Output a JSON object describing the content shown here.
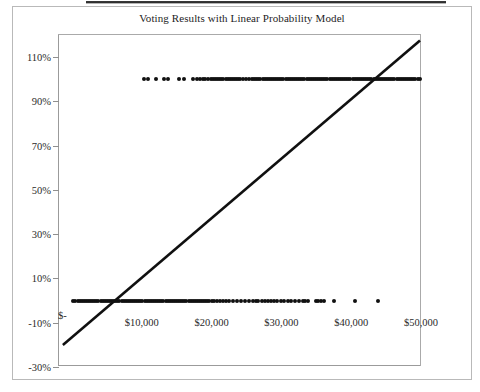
{
  "figure": {
    "title": "Voting Results with Linear Probability Model",
    "border_color": "#b9b9b9",
    "axis_color": "#9b9b9b",
    "marker_color": "#101010",
    "fit_line_color": "#101010",
    "background": "#ffffff"
  },
  "scan_artifact": {
    "present": true,
    "description": "dark horizontal scan band across top edge"
  },
  "chart_data": {
    "type": "scatter",
    "title": "Voting Results with Linear Probability Model",
    "xlabel": "",
    "ylabel": "",
    "xlim": [
      -2000,
      50000
    ],
    "ylim": [
      -0.3,
      1.2
    ],
    "grid": false,
    "legend": null,
    "y_tick_labels": [
      "110%",
      "90%",
      "70%",
      "50%",
      "30%",
      "10%",
      "-10%",
      "-30%"
    ],
    "y_tick_values": [
      1.1,
      0.9,
      0.7,
      0.5,
      0.3,
      0.1,
      -0.1,
      -0.3
    ],
    "x_tick_labels": [
      "$-",
      "$10,000",
      "$20,000",
      "$30,000",
      "$40,000",
      "$50,000"
    ],
    "x_tick_values": [
      0,
      10000,
      20000,
      30000,
      40000,
      50000
    ],
    "series": [
      {
        "name": "Voted (y = 1)",
        "y_value": 1.0,
        "marker": "diamond",
        "x_values": [
          10300,
          10900,
          12100,
          13200,
          13700,
          15400,
          16000,
          17300,
          17900,
          18300,
          18700,
          19100,
          19500,
          19900,
          20200,
          20500,
          20800,
          21100,
          21400,
          21700,
          22000,
          22300,
          22600,
          22900,
          23200,
          23500,
          23800,
          24100,
          24500,
          25000,
          25400,
          25800,
          26100,
          26400,
          26700,
          27000,
          27300,
          27600,
          27900,
          28200,
          28500,
          28800,
          29100,
          29400,
          29700,
          30000,
          30300,
          30600,
          30900,
          31200,
          31500,
          31800,
          32100,
          32400,
          32700,
          33000,
          33300,
          33600,
          33900,
          34200,
          34500,
          34800,
          35100,
          35400,
          35700,
          36000,
          36300,
          36600,
          36900,
          37200,
          37500,
          37800,
          38100,
          38400,
          38700,
          39000,
          39300,
          39600,
          39900,
          40200,
          40500,
          40800,
          41100,
          41400,
          41700,
          42000,
          42300,
          42600,
          42900,
          43200,
          43500,
          43800,
          44100,
          44400,
          44700,
          45000,
          45300,
          45600,
          45900,
          46200,
          46500,
          46800,
          47100,
          47400,
          47700,
          48000,
          48300,
          48600,
          48900,
          49200,
          49500,
          49800
        ]
      },
      {
        "name": "Did not vote (y = 0)",
        "y_value": 0.0,
        "marker": "diamond",
        "x_values": [
          200,
          500,
          800,
          1100,
          1400,
          1700,
          2000,
          2300,
          2600,
          2900,
          3200,
          3500,
          3800,
          4100,
          4400,
          4700,
          5000,
          5300,
          5600,
          5900,
          6200,
          6500,
          6800,
          7100,
          7400,
          7700,
          8000,
          8300,
          8600,
          8900,
          9200,
          9500,
          9800,
          10100,
          10400,
          10700,
          11000,
          11300,
          11600,
          11900,
          12200,
          12500,
          12800,
          13100,
          13400,
          13700,
          14000,
          14300,
          14600,
          14900,
          15200,
          15500,
          15800,
          16100,
          16400,
          16700,
          17000,
          17300,
          17600,
          17900,
          18200,
          18500,
          18800,
          19100,
          19400,
          19700,
          20000,
          20400,
          20800,
          21200,
          21600,
          22000,
          22500,
          23000,
          23600,
          24200,
          24800,
          25400,
          26000,
          26300,
          26700,
          27200,
          27600,
          28100,
          28500,
          29000,
          29400,
          29900,
          30400,
          30900,
          31400,
          31900,
          32500,
          33100,
          33400,
          33800,
          34900,
          35300,
          35700,
          36100,
          37600,
          40600,
          43800
        ]
      }
    ],
    "fit_line": {
      "name": "Linear Probability Model",
      "type": "line",
      "x_start": -1300,
      "y_start": -0.205,
      "x_end": 50000,
      "y_end": 1.175
    },
    "annotations": []
  }
}
